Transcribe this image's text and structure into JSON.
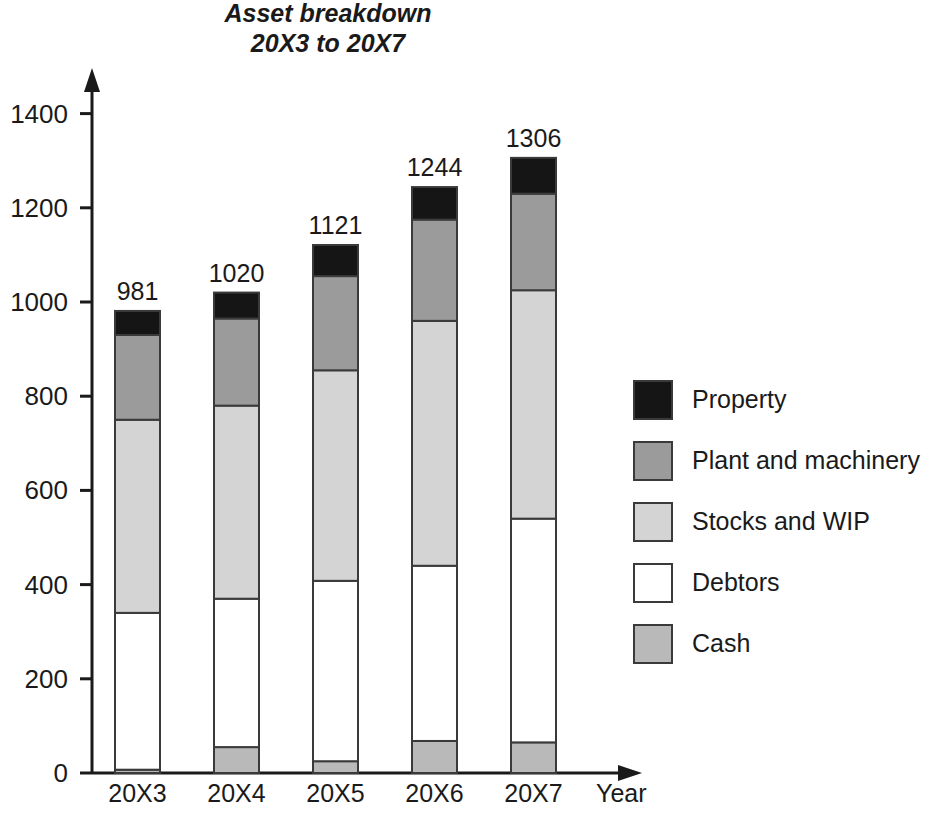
{
  "chart_data": {
    "type": "bar",
    "subtype": "stacked-bar",
    "title": "Asset breakdown",
    "subtitle": "20X3 to 20X7",
    "xlabel": "Year",
    "ylabel": "",
    "categories": [
      "20X3",
      "20X4",
      "20X5",
      "20X6",
      "20X7"
    ],
    "ylim": [
      0,
      1400
    ],
    "yticks": [
      0,
      200,
      400,
      600,
      800,
      1000,
      1200,
      1400
    ],
    "ytick_labels": [
      "0",
      "200",
      "400",
      "600",
      "800",
      "1000",
      "1200",
      "1400"
    ],
    "grid": false,
    "legend_position": "right",
    "stack_order_bottom_to_top": [
      "Cash",
      "Debtors",
      "Stocks and WIP",
      "Plant and machinery",
      "Property"
    ],
    "series": [
      {
        "name": "Cash",
        "color": "#b9b9b9",
        "values": [
          7,
          55,
          25,
          68,
          65
        ]
      },
      {
        "name": "Debtors",
        "color": "#ffffff",
        "values": [
          333,
          315,
          383,
          372,
          475
        ]
      },
      {
        "name": "Stocks and WIP",
        "color": "#d4d4d4",
        "values": [
          410,
          410,
          447,
          520,
          485
        ]
      },
      {
        "name": "Plant and machinery",
        "color": "#9b9b9b",
        "values": [
          180,
          185,
          200,
          215,
          205
        ]
      },
      {
        "name": "Property",
        "color": "#151515",
        "values": [
          51,
          55,
          66,
          69,
          76
        ]
      }
    ],
    "totals": [
      981,
      1020,
      1121,
      1244,
      1306
    ],
    "total_labels": [
      "981",
      "1020",
      "1121",
      "1244",
      "1306"
    ],
    "legend": [
      {
        "label": "Property",
        "color": "#151515"
      },
      {
        "label": "Plant and machinery",
        "color": "#9b9b9b"
      },
      {
        "label": "Stocks and WIP",
        "color": "#d4d4d4"
      },
      {
        "label": "Debtors",
        "color": "#ffffff"
      },
      {
        "label": "Cash",
        "color": "#b9b9b9"
      }
    ]
  },
  "axes": {
    "y_arrow_icon": "arrow-up-icon",
    "x_arrow_icon": "arrow-right-icon"
  }
}
